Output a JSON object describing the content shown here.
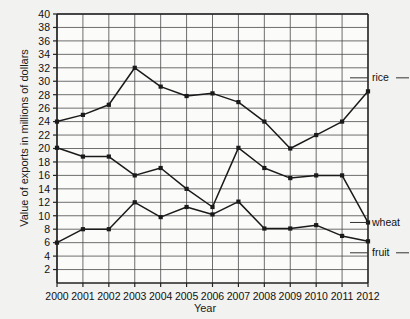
{
  "chart_data": {
    "type": "line",
    "title": "",
    "xlabel": "Year",
    "ylabel": "Value of exports in millions of dollars",
    "categories": [
      2000,
      2001,
      2002,
      2003,
      2004,
      2005,
      2006,
      2007,
      2008,
      2009,
      2010,
      2011,
      2012
    ],
    "xlim": [
      2000,
      2012
    ],
    "ylim": [
      0,
      40
    ],
    "ytick_step": 2,
    "yticks": [
      2,
      4,
      6,
      8,
      10,
      12,
      14,
      16,
      18,
      20,
      22,
      24,
      26,
      28,
      30,
      32,
      34,
      36,
      38,
      40
    ],
    "xticks": [
      "2000",
      "2001",
      "2002",
      "2003",
      "2004",
      "2005",
      "2006",
      "2007",
      "2008",
      "2009",
      "2010",
      "2011",
      "2012"
    ],
    "grid": true,
    "legend_position": "inline-right",
    "marker": "filled-square",
    "line_color": "#1a1a1a",
    "series": [
      {
        "name": "rice",
        "label": "rice",
        "values": [
          24,
          25,
          26.5,
          32,
          29.2,
          27.8,
          28.2,
          26.9,
          24,
          20,
          22,
          24,
          28.5
        ]
      },
      {
        "name": "wheat",
        "label": "wheat",
        "values": [
          20.1,
          18.8,
          18.8,
          16,
          17.1,
          14,
          11.3,
          20.1,
          17.1,
          15.6,
          16,
          16,
          9
        ]
      },
      {
        "name": "fruit",
        "label": "fruit",
        "values": [
          6,
          8,
          8,
          12,
          9.8,
          11.3,
          10.2,
          12.1,
          8.1,
          8.1,
          8.6,
          7,
          6.2
        ]
      }
    ]
  },
  "axis_titles": {
    "x": "Year",
    "y": "Value of exports in millions of dollars"
  }
}
